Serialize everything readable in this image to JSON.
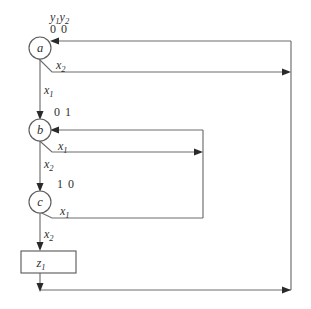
{
  "diagram": {
    "title_labels": {
      "state_vars": "y1y2",
      "state_vars_base": "y",
      "state_vars_sub1": "1",
      "state_vars_base2": "y",
      "state_vars_sub2": "2"
    },
    "nodes": [
      {
        "id": "a",
        "label": "a",
        "state_bits": "0 0",
        "cx": 40,
        "cy": 48,
        "r": 11
      },
      {
        "id": "b",
        "label": "b",
        "state_bits": "0 1",
        "cx": 40,
        "cy": 130,
        "r": 11
      },
      {
        "id": "c",
        "label": "c",
        "state_bits": "1 0",
        "cx": 40,
        "cy": 202,
        "r": 11
      }
    ],
    "output_box": {
      "label_base": "z",
      "label_sub": "1",
      "label": "z1",
      "x": 21,
      "y": 251,
      "width": 55,
      "height": 22
    },
    "edges": [
      {
        "id": "a-to-b",
        "from": "a",
        "to": "b",
        "label_base": "x",
        "label_sub": "1",
        "label": "x1"
      },
      {
        "id": "a-to-self-right",
        "from": "a",
        "to": "a",
        "label_base": "x",
        "label_sub": "2",
        "label": "x2"
      },
      {
        "id": "b-to-c",
        "from": "b",
        "to": "c",
        "label_base": "x",
        "label_sub": "2",
        "label": "x2"
      },
      {
        "id": "b-to-b-loop",
        "from": "b",
        "to": "b",
        "label_base": "x",
        "label_sub": "1",
        "label": "x1"
      },
      {
        "id": "c-to-b-loop",
        "from": "c",
        "to": "b",
        "label_base": "x",
        "label_sub": "1",
        "label": "x1"
      },
      {
        "id": "c-to-output",
        "from": "c",
        "to": "z1",
        "label_base": "x",
        "label_sub": "2",
        "label": "x2"
      }
    ],
    "colors": {
      "line": "#6d6d6d",
      "node_stroke": "#5e5e5e",
      "text": "#2f2f2f",
      "arrow": "#2a2a2a",
      "background": "#ffffff"
    }
  }
}
